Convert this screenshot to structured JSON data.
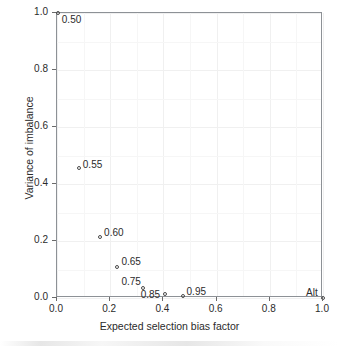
{
  "chart_data": {
    "type": "scatter",
    "title": "",
    "subtitle": "",
    "xlabel": "Expected selection bias factor",
    "ylabel": "Variance of imbalance",
    "xlim": [
      0.0,
      1.0
    ],
    "ylim": [
      0.0,
      1.0
    ],
    "xticks": [
      "0.0",
      "0.2",
      "0.4",
      "0.6",
      "0.8",
      "1.0"
    ],
    "xtick_values": [
      0.0,
      0.2,
      0.4,
      0.6,
      0.8,
      1.0
    ],
    "yticks": [
      "0.0",
      "0.2",
      "0.4",
      "0.6",
      "0.8",
      "1.0"
    ],
    "ytick_values": [
      0.0,
      0.2,
      0.4,
      0.6,
      0.8,
      1.0
    ],
    "grid": true,
    "legend": "none",
    "marker": "open-circle",
    "points": [
      {
        "label": "0.50",
        "x": 0.003,
        "y": 1.0,
        "label_dx": 4,
        "label_dy": 2
      },
      {
        "label": "0.55",
        "x": 0.082,
        "y": 0.455,
        "label_dx": 4,
        "label_dy": -8
      },
      {
        "label": "0.60",
        "x": 0.162,
        "y": 0.215,
        "label_dx": 4,
        "label_dy": -9
      },
      {
        "label": "0.65",
        "x": 0.227,
        "y": 0.108,
        "label_dx": 4,
        "label_dy": -10
      },
      {
        "label": "0.75",
        "x": 0.325,
        "y": 0.035,
        "label_dx": -22,
        "label_dy": -11
      },
      {
        "label": "0.85",
        "x": 0.405,
        "y": 0.014,
        "label_dx": -24,
        "label_dy": -4
      },
      {
        "label": "0.95",
        "x": 0.472,
        "y": 0.008,
        "label_dx": 4,
        "label_dy": -9
      },
      {
        "label": "Alt",
        "x": 1.0,
        "y": 0.0,
        "label_dx": -17,
        "label_dy": -10
      }
    ]
  }
}
